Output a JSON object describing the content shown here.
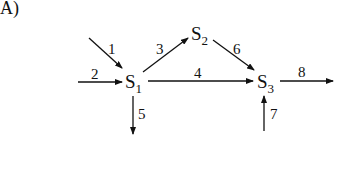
{
  "panel_label": "A)",
  "nodes": {
    "s1": {
      "main": "S",
      "sub": "1"
    },
    "s2": {
      "main": "S",
      "sub": "2"
    },
    "s3": {
      "main": "S",
      "sub": "3"
    }
  },
  "edges": [
    {
      "id": "1",
      "label": "1",
      "from": "external",
      "to": "S1"
    },
    {
      "id": "2",
      "label": "2",
      "from": "external",
      "to": "S1"
    },
    {
      "id": "3",
      "label": "3",
      "from": "S1",
      "to": "S2"
    },
    {
      "id": "4",
      "label": "4",
      "from": "S1",
      "to": "S3"
    },
    {
      "id": "5",
      "label": "5",
      "from": "S1",
      "to": "external"
    },
    {
      "id": "6",
      "label": "6",
      "from": "S2",
      "to": "S3"
    },
    {
      "id": "7",
      "label": "7",
      "from": "external",
      "to": "S3"
    },
    {
      "id": "8",
      "label": "8",
      "from": "S3",
      "to": "external"
    }
  ],
  "colors": {
    "stroke": "#111111",
    "background": "#ffffff"
  }
}
